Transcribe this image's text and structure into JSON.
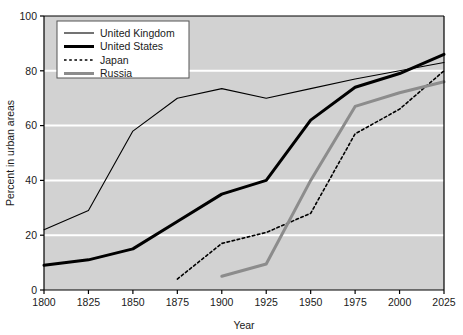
{
  "chart_data": {
    "type": "line",
    "title": "",
    "xlabel": "Year",
    "ylabel": "Percent in urban areas",
    "xlim": [
      1800,
      2025
    ],
    "ylim": [
      0,
      100
    ],
    "xticks": [
      1800,
      1825,
      1850,
      1875,
      1900,
      1925,
      1950,
      1975,
      2000,
      2025
    ],
    "yticks": [
      0,
      20,
      40,
      60,
      80,
      100
    ],
    "grid": "horizontal-white-gridlines",
    "legend_position": "top-left-inside",
    "plot_background": "#d2d2d2",
    "gridline_color": "#ffffff",
    "axis_color": "#000000",
    "series": [
      {
        "name": "United Kingdom",
        "style": "thin-solid",
        "color": "#000000",
        "width": 1.1,
        "x": [
          1800,
          1825,
          1850,
          1875,
          1900,
          1925,
          1950,
          1975,
          2000,
          2025
        ],
        "values": [
          22,
          29,
          58,
          70,
          73.5,
          70,
          73.5,
          77,
          80,
          83
        ]
      },
      {
        "name": "United States",
        "style": "thick-solid",
        "color": "#000000",
        "width": 3.0,
        "x": [
          1800,
          1825,
          1850,
          1875,
          1900,
          1925,
          1950,
          1975,
          2000,
          2025
        ],
        "values": [
          9,
          11,
          15,
          25,
          35,
          40,
          62,
          74,
          79,
          86
        ]
      },
      {
        "name": "Japan",
        "style": "dashed",
        "color": "#000000",
        "width": 1.6,
        "x": [
          1875,
          1900,
          1925,
          1950,
          1975,
          2000,
          2025
        ],
        "values": [
          4,
          17,
          21,
          28,
          57,
          66,
          80
        ]
      },
      {
        "name": "Russia",
        "style": "thick-solid",
        "color": "#8c8c8c",
        "width": 3.0,
        "x": [
          1900,
          1925,
          1950,
          1975,
          2000,
          2025
        ],
        "values": [
          5,
          9.5,
          40,
          67,
          72,
          76
        ]
      }
    ]
  },
  "axes": {
    "y_title": "Percent in urban areas",
    "x_title": "Year",
    "y_tick_labels": [
      "0",
      "20",
      "40",
      "60",
      "80",
      "100"
    ],
    "x_tick_labels": [
      "1800",
      "1825",
      "1850",
      "1875",
      "1900",
      "1925",
      "1950",
      "1975",
      "2000",
      "2025"
    ]
  },
  "legend": {
    "items": [
      {
        "label": "United Kingdom",
        "swatch": "thin-solid-black"
      },
      {
        "label": "United States",
        "swatch": "thick-solid-black"
      },
      {
        "label": "Japan",
        "swatch": "dashed-black"
      },
      {
        "label": "Russia",
        "swatch": "thick-solid-gray"
      }
    ]
  }
}
